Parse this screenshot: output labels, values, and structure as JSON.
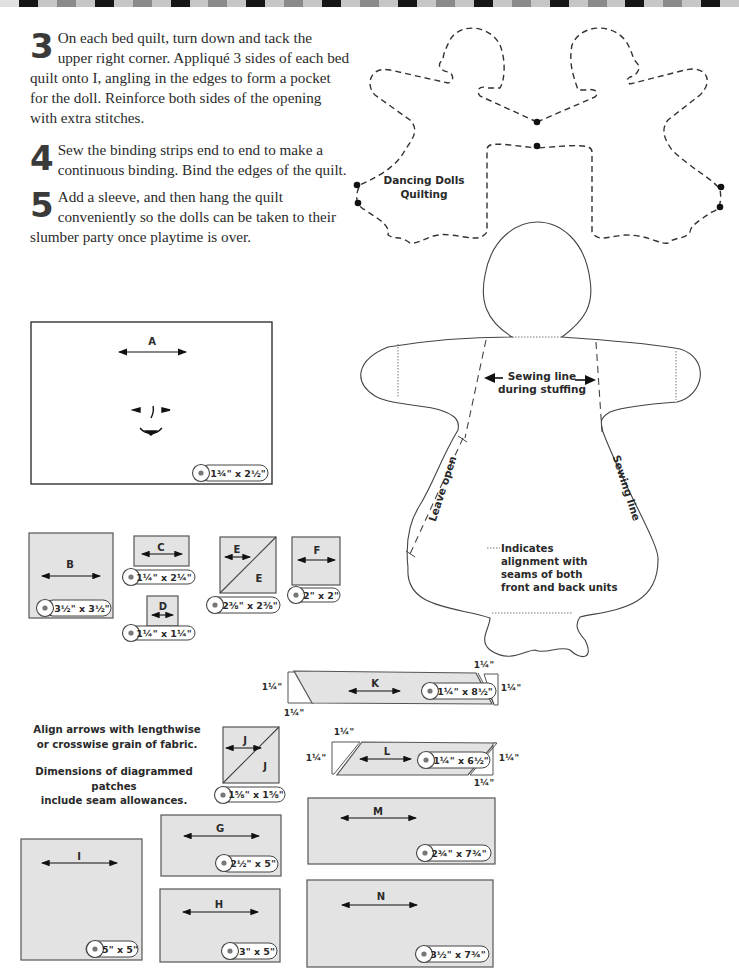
{
  "header_bar": {
    "colors": [
      "#e0e0e0",
      "#161616",
      "#c6c6c6",
      "#8a8a8a",
      "#c6c6c6",
      "#161616",
      "#c6c6c6",
      "#8a8a8a",
      "#c6c6c6",
      "#161616",
      "#c6c6c6",
      "#8a8a8a",
      "#c6c6c6",
      "#161616",
      "#c6c6c6",
      "#8a8a8a",
      "#c6c6c6",
      "#161616",
      "#c6c6c6",
      "#8a8a8a",
      "#c6c6c6",
      "#161616",
      "#c6c6c6",
      "#8a8a8a",
      "#c6c6c6",
      "#161616",
      "#c6c6c6",
      "#8a8a8a",
      "#c6c6c6",
      "#161616",
      "#c6c6c6",
      "#8a8a8a",
      "#c6c6c6",
      "#161616",
      "#c6c6c6",
      "#8a8a8a",
      "#c6c6c6",
      "#161616",
      "#c6c6c6"
    ]
  },
  "steps": [
    {
      "number": "3",
      "text": "On each bed quilt, turn down and tack the upper right corner. Appliqué 3 sides of each bed quilt onto I, angling in the edges to form a pocket for the doll. Reinforce both sides of the opening with extra stitches."
    },
    {
      "number": "4",
      "text": "Sew the binding strips end to end to make a continuous binding. Bind the edges of the quilt."
    },
    {
      "number": "5",
      "text": "Add a sleeve, and then hang the quilt conveniently so the dolls can be taken to their slumber party once playtime is over."
    }
  ],
  "quilting_pattern": {
    "title_line1": "Dancing Dolls",
    "title_line2": "Quilting"
  },
  "doll_template": {
    "stuffing_label_line1": "Sewing line",
    "stuffing_label_line2": "during stuffing",
    "leave_open": "Leave open",
    "sewing_line": "Sewing line",
    "legend_line1": "Indicates",
    "legend_line2": "alignment with",
    "legend_line3": "seams of both",
    "legend_line4": "front and back units"
  },
  "notes": {
    "line1": "Align arrows with lengthwise",
    "line2": "or crosswise grain of fabric.",
    "line3": "Dimensions of diagrammed patches",
    "line4": "include seam allowances."
  },
  "patches": {
    "A": {
      "label": "A",
      "size": "1¾\" x 2½\""
    },
    "B": {
      "label": "B",
      "size": "3½\" x 3½\""
    },
    "C": {
      "label": "C",
      "size": "1¼\" x 2¼\""
    },
    "D": {
      "label": "D",
      "size": "1¼\" x 1¼\""
    },
    "E": {
      "label": "E",
      "size": "2⅜\" x 2⅜\""
    },
    "F": {
      "label": "F",
      "size": "2\" x 2\""
    },
    "G": {
      "label": "G",
      "size": "2½\" x 5\""
    },
    "H": {
      "label": "H",
      "size": "3\" x 5\""
    },
    "I": {
      "label": "I",
      "size": "5\" x 5\""
    },
    "J": {
      "label": "J",
      "size": "1⅝\" x 1⅝\""
    },
    "K": {
      "label": "K",
      "size": "1¼\" x 8½\"",
      "trim": "1¼\""
    },
    "L": {
      "label": "L",
      "size": "1¼\" x 6½\"",
      "trim": "1¼\""
    },
    "M": {
      "label": "M",
      "size": "2¾\" x 7¾\""
    },
    "N": {
      "label": "N",
      "size": "3½\" x 7¾\""
    }
  }
}
